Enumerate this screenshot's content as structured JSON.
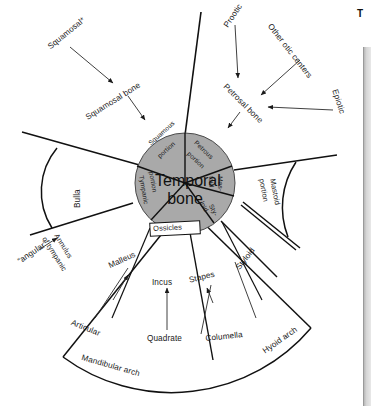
{
  "figure": {
    "center_label_line1": "Temporal",
    "center_label_line2": "bone",
    "corner_mark": "T"
  },
  "core_sectors": [
    {
      "name": "squamous-portion",
      "line1": "Squamous",
      "line2": "portion"
    },
    {
      "name": "petrous-portion",
      "line1": "Petrous",
      "line2": "portion"
    },
    {
      "name": "mastoid",
      "line1": "Mas-",
      "line2": "toid"
    },
    {
      "name": "styloid",
      "line1": "Sty-",
      "line2": "loid"
    },
    {
      "name": "tympanic-portion",
      "line1": "Tympanic",
      "line2": "portion"
    }
  ],
  "outer_wedges": [
    {
      "name": "bulla",
      "label": "Bulla"
    },
    {
      "name": "mastoid-portion",
      "line1": "Mastoid",
      "line2": "portion"
    },
    {
      "name": "styloid-wedge",
      "label": "Styloid"
    },
    {
      "name": "ossicles",
      "label": "Ossicles"
    }
  ],
  "arc_labels": [
    {
      "name": "mandibular-arch",
      "label": "Mandibular arch"
    },
    {
      "name": "hyoid-arch",
      "label": "Hyoid arch"
    }
  ],
  "annotations": [
    {
      "name": "squamosal-precursor",
      "label": "Squamosal*"
    },
    {
      "name": "squamosal-bone",
      "label": "Squamosal bone"
    },
    {
      "name": "prootic",
      "label": "Prootic"
    },
    {
      "name": "other-otic-centers",
      "label": "Other otic centers"
    },
    {
      "name": "petrosal-bone",
      "label": "Petrosal bone"
    },
    {
      "name": "epiotic",
      "label": "Epiotic"
    },
    {
      "name": "annulus-of-tympanic-l1",
      "label": "Annulus"
    },
    {
      "name": "annulus-of-tympanic-l2",
      "label": "of tympanic"
    },
    {
      "name": "angular-precursor",
      "label": "“angular”"
    },
    {
      "name": "malleus",
      "label": "Malleus"
    },
    {
      "name": "incus",
      "label": "Incus"
    },
    {
      "name": "stapes",
      "label": "Stapes"
    },
    {
      "name": "articular",
      "label": "Articular"
    },
    {
      "name": "quadrate",
      "label": "Quadrate"
    },
    {
      "name": "columella",
      "label": "Columella"
    }
  ],
  "colors": {
    "core_fill": "#a9a9a9",
    "stroke": "#111111",
    "background": "#ffffff",
    "scan_edge": "#b8b8b8"
  }
}
